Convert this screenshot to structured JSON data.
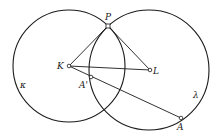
{
  "diagram": {
    "type": "geometry",
    "colors": {
      "stroke": "#1a1a1a",
      "background": "#ffffff"
    },
    "circles": [
      {
        "name": "kappa",
        "label": "κ",
        "cx": 69,
        "cy": 66,
        "r": 56,
        "label_x": 20,
        "label_y": 88
      },
      {
        "name": "lambda",
        "label": "λ",
        "cx": 149,
        "cy": 70,
        "r": 60,
        "label_x": 193,
        "label_y": 98
      }
    ],
    "points": [
      {
        "name": "P",
        "label": "P",
        "x": 108,
        "y": 26,
        "label_x": 105,
        "label_y": 20,
        "shape": "square"
      },
      {
        "name": "K",
        "label": "K",
        "x": 69,
        "y": 66,
        "label_x": 57,
        "label_y": 69,
        "shape": "circle"
      },
      {
        "name": "L",
        "label": "L",
        "x": 150,
        "y": 70,
        "label_x": 153,
        "label_y": 74,
        "shape": "circle"
      },
      {
        "name": "A_prime",
        "label": "A'",
        "x": 91,
        "y": 77,
        "label_x": 79,
        "label_y": 88,
        "shape": "circle"
      },
      {
        "name": "A",
        "label": "A",
        "x": 181,
        "y": 118,
        "label_x": 177,
        "label_y": 130,
        "shape": "circle"
      }
    ],
    "segments": [
      {
        "name": "K-P",
        "from": "K",
        "to": "P"
      },
      {
        "name": "P-L",
        "from": "P",
        "to": "L"
      },
      {
        "name": "K-L",
        "from": "K",
        "to": "L"
      },
      {
        "name": "K-A",
        "from": "K",
        "to": "A"
      }
    ]
  }
}
